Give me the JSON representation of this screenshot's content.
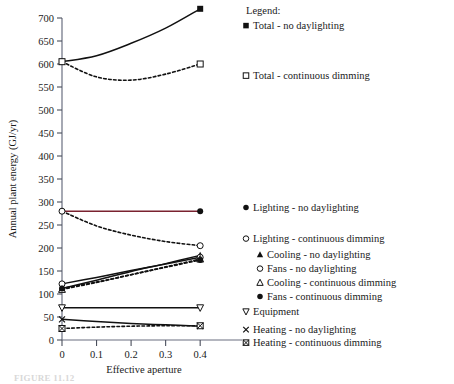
{
  "figure": {
    "caption": "FIGURE 11.12"
  },
  "chart_data": {
    "type": "line",
    "title": "",
    "xlabel": "Effective aperture",
    "ylabel": "Annual plant energy (GJ/yr)",
    "xlim": [
      0,
      0.44
    ],
    "ylim": [
      0,
      700
    ],
    "xticks": [
      "0",
      "0.1",
      "0.2",
      "0.3",
      "0.4"
    ],
    "xtick_values": [
      0,
      0.1,
      0.2,
      0.3,
      0.4
    ],
    "yticks": [
      "0",
      "50",
      "100",
      "150",
      "200",
      "250",
      "300",
      "350",
      "400",
      "450",
      "500",
      "550",
      "600",
      "650",
      "700"
    ],
    "ytick_values": [
      0,
      50,
      100,
      150,
      200,
      250,
      300,
      350,
      400,
      450,
      500,
      550,
      600,
      650,
      700
    ],
    "grid": false,
    "legend_position": "right",
    "legend_title": "Legend:",
    "x": [
      0,
      0.1,
      0.2,
      0.3,
      0.4
    ],
    "series": [
      {
        "name": "Total - no daylighting",
        "marker": "filled-square",
        "style": "solid",
        "color": "#111111",
        "values": [
          605,
          618,
          645,
          678,
          720
        ]
      },
      {
        "name": "Total - continuous dimming",
        "marker": "open-square",
        "style": "dashed",
        "color": "#111111",
        "values": [
          605,
          572,
          565,
          578,
          600
        ]
      },
      {
        "name": "Lighting - no daylighting",
        "marker": "filled-circle",
        "style": "solid",
        "color": "#7a2230",
        "values": [
          280,
          280,
          280,
          280,
          280
        ]
      },
      {
        "name": "Lighting - continuous dimming",
        "marker": "open-circle",
        "style": "dashed",
        "color": "#111111",
        "values": [
          280,
          248,
          228,
          214,
          205
        ]
      },
      {
        "name": "Cooling - no daylighting",
        "marker": "filled-triangle",
        "style": "solid",
        "color": "#111111",
        "values": [
          112,
          130,
          149,
          166,
          184
        ]
      },
      {
        "name": "Fans - no daylighting",
        "marker": "open-circle",
        "style": "solid",
        "color": "#111111",
        "values": [
          122,
          136,
          151,
          165,
          180
        ]
      },
      {
        "name": "Cooling - continuous dimming",
        "marker": "open-triangle",
        "style": "dashed",
        "color": "#111111",
        "values": [
          110,
          125,
          142,
          159,
          176
        ]
      },
      {
        "name": "Fans - continuous dimming",
        "marker": "filled-circle",
        "style": "dashed",
        "color": "#111111",
        "values": [
          112,
          126,
          142,
          158,
          174
        ]
      },
      {
        "name": "Equipment",
        "marker": "open-down-triangle",
        "style": "solid",
        "color": "#111111",
        "values": [
          70,
          70,
          70,
          70,
          70
        ]
      },
      {
        "name": "Heating - no daylighting",
        "marker": "cross",
        "style": "solid",
        "color": "#111111",
        "values": [
          45,
          40,
          36,
          33,
          30
        ]
      },
      {
        "name": "Heating - continuous dimming",
        "marker": "crossed-square",
        "style": "dashed",
        "color": "#111111",
        "values": [
          25,
          28,
          30,
          31,
          31
        ]
      }
    ]
  },
  "legend": {
    "title": "Legend:",
    "entries": [
      {
        "label": "Total - no daylighting",
        "marker": "filled-square"
      },
      {
        "label": "Total - continuous dimming",
        "marker": "open-square"
      },
      {
        "label": "Lighting - no daylighting",
        "marker": "filled-circle"
      },
      {
        "label": "Lighting - continuous dimming",
        "marker": "open-circle"
      },
      {
        "label": "Cooling - no daylighting",
        "marker": "filled-triangle"
      },
      {
        "label": "Fans - no daylighting",
        "marker": "open-circle"
      },
      {
        "label": "Cooling - continuous dimming",
        "marker": "open-triangle"
      },
      {
        "label": "Fans - continuous dimming",
        "marker": "filled-circle"
      },
      {
        "label": "Equipment",
        "marker": "open-down-triangle"
      },
      {
        "label": "Heating - no daylighting",
        "marker": "cross"
      },
      {
        "label": "Heating - continuous dimming",
        "marker": "crossed-square"
      }
    ]
  }
}
